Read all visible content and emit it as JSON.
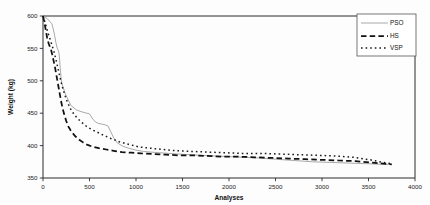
{
  "chart_data": {
    "type": "line",
    "title": "",
    "xlabel": "Analyses",
    "ylabel": "Weight (kg)",
    "xlim": [
      0,
      4000
    ],
    "ylim": [
      350,
      600
    ],
    "xticks": [
      0,
      500,
      1000,
      1500,
      2000,
      2500,
      3000,
      3500,
      4000
    ],
    "yticks": [
      350,
      400,
      450,
      500,
      550,
      600
    ],
    "grid": false,
    "legend_position": "top-right",
    "series": [
      {
        "name": "PSO",
        "style": "solid",
        "color": "#9a9a9a",
        "x": [
          0,
          20,
          45,
          70,
          95,
          110,
          125,
          140,
          150,
          160,
          168,
          175,
          185,
          200,
          240,
          300,
          360,
          420,
          470,
          500,
          540,
          570,
          600,
          640,
          670,
          700,
          730,
          760,
          800,
          860,
          920,
          1000,
          1080,
          1160,
          1250,
          1350,
          1450,
          1560,
          1700,
          1850,
          2000,
          2150,
          2300,
          2500,
          2700,
          2900,
          3100,
          3300,
          3500,
          3650,
          3750
        ],
        "y": [
          600,
          598,
          596,
          592,
          588,
          580,
          570,
          558,
          552,
          548,
          545,
          540,
          520,
          497,
          480,
          462,
          455,
          452,
          450,
          449,
          440,
          436,
          434,
          433,
          432,
          430,
          421,
          412,
          404,
          399,
          396,
          393,
          391,
          390,
          389,
          388,
          387,
          386,
          385,
          384,
          383,
          382,
          381,
          379,
          377,
          375,
          374,
          373,
          372,
          371,
          371
        ]
      },
      {
        "name": "HS",
        "style": "dashed",
        "color": "#111111",
        "x": [
          0,
          15,
          30,
          45,
          60,
          75,
          90,
          100,
          112,
          125,
          135,
          145,
          155,
          165,
          175,
          185,
          195,
          210,
          230,
          250,
          270,
          295,
          320,
          350,
          390,
          430,
          480,
          540,
          600,
          680,
          760,
          850,
          950,
          1050,
          1180,
          1320,
          1460,
          1600,
          1760,
          1920,
          2100,
          2280,
          2460,
          2640,
          2820,
          3000,
          3180,
          3360,
          3520,
          3660,
          3750
        ],
        "y": [
          600,
          590,
          578,
          566,
          558,
          552,
          546,
          540,
          532,
          524,
          516,
          508,
          500,
          492,
          484,
          476,
          468,
          458,
          447,
          438,
          430,
          424,
          419,
          414,
          409,
          405,
          401,
          398,
          396,
          394,
          392,
          390,
          389,
          388,
          387,
          386,
          385,
          385,
          384,
          383,
          383,
          382,
          381,
          380,
          379,
          378,
          377,
          376,
          374,
          372,
          371
        ]
      },
      {
        "name": "VSP",
        "style": "dotted",
        "color": "#1a1a1a",
        "x": [
          0,
          18,
          36,
          54,
          72,
          90,
          105,
          118,
          130,
          142,
          155,
          168,
          180,
          195,
          215,
          240,
          265,
          295,
          330,
          370,
          415,
          465,
          520,
          580,
          650,
          730,
          820,
          920,
          1030,
          1150,
          1290,
          1440,
          1600,
          1770,
          1950,
          2140,
          2340,
          2540,
          2740,
          2940,
          3140,
          3340,
          3520,
          3660,
          3750
        ],
        "y": [
          600,
          592,
          583,
          574,
          566,
          558,
          551,
          545,
          538,
          531,
          523,
          515,
          507,
          498,
          487,
          476,
          466,
          457,
          449,
          442,
          436,
          430,
          425,
          421,
          416,
          411,
          406,
          402,
          398,
          396,
          394,
          392,
          391,
          390,
          389,
          388,
          388,
          387,
          386,
          385,
          384,
          382,
          378,
          374,
          372
        ]
      }
    ]
  },
  "legend": {
    "entries": [
      {
        "label": "PSO"
      },
      {
        "label": "HS"
      },
      {
        "label": "VSP"
      }
    ]
  },
  "axes": {
    "x_title": "Analyses",
    "y_title": "Weight (kg)",
    "x_tick_labels": [
      "0",
      "500",
      "1000",
      "1500",
      "2000",
      "2500",
      "3000",
      "3500",
      "4000"
    ],
    "y_tick_labels": [
      "350",
      "400",
      "450",
      "500",
      "550",
      "600"
    ]
  }
}
